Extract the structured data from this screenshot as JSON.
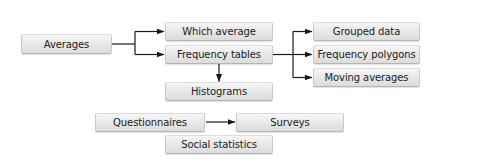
{
  "diagram": {
    "type": "flowchart",
    "nodes": {
      "averages": "Averages",
      "which_average": "Which average",
      "frequency_tables": "Frequency tables",
      "histograms": "Histograms",
      "grouped_data": "Grouped data",
      "frequency_polygons": "Frequency polygons",
      "moving_averages": "Moving averages",
      "questionnaires": "Questionnaires",
      "surveys": "Surveys",
      "social_statistics": "Social statistics"
    },
    "edges": [
      {
        "from": "Averages",
        "to": "Which average"
      },
      {
        "from": "Averages",
        "to": "Frequency tables"
      },
      {
        "from": "Frequency tables",
        "to": "Histograms"
      },
      {
        "from": "Frequency tables",
        "to": "Grouped data"
      },
      {
        "from": "Frequency tables",
        "to": "Frequency polygons"
      },
      {
        "from": "Frequency tables",
        "to": "Moving averages"
      },
      {
        "from": "Questionnaires",
        "to": "Surveys"
      }
    ],
    "colors": {
      "box_fill_top": "#f6f6f6",
      "box_fill_bottom": "#dcdcdc",
      "box_border": "#c9c9c9",
      "arrow": "#1a1a1a",
      "text": "#222222"
    }
  }
}
